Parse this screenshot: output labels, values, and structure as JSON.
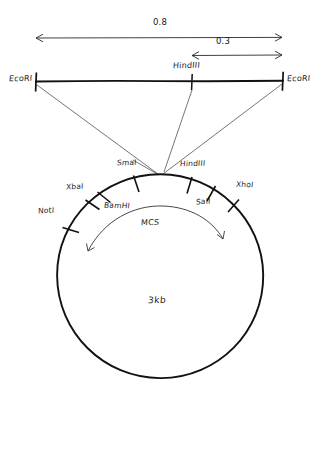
{
  "figure": {
    "type": "plasmid-restriction-map",
    "linear_map": {
      "left_site_label": "EcoRI",
      "right_site_label": "EcoRI",
      "internal_site_label": "HindIII",
      "dimensions": [
        {
          "label": "0.8",
          "span": "EcoRI-to-EcoRI"
        },
        {
          "label": "0.3",
          "span": "HindIII-to-EcoRI"
        }
      ]
    },
    "plasmid": {
      "size_label": "3kb",
      "mcs_label": "MCS",
      "sites": [
        {
          "label": "NotI"
        },
        {
          "label": "XbaI"
        },
        {
          "label": "BamHI"
        },
        {
          "label": "SmaI"
        },
        {
          "label": "HindIII"
        },
        {
          "label": "SalI"
        },
        {
          "label": "XhoI"
        }
      ]
    },
    "colors": {
      "ink": "#1a1a1a",
      "stroke": "#222222"
    }
  }
}
